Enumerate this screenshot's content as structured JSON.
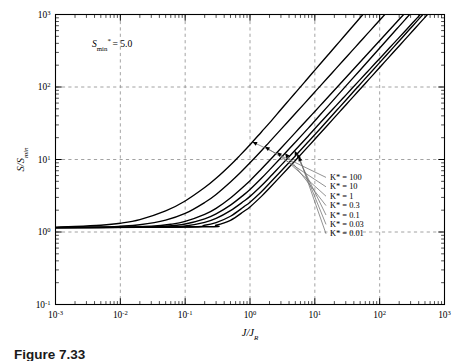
{
  "figure": {
    "caption_fragment": "Figure 7.33",
    "annotation": "S",
    "annotation_sub": "min",
    "annotation_star": "*",
    "annotation_value": "= 5.0"
  },
  "axes": {
    "x": {
      "label_num": "J",
      "label_den": "J",
      "label_den_sub": "R",
      "ticks": [
        "10",
        "10",
        "10",
        "10",
        "10",
        "10",
        "10"
      ],
      "exponents": [
        "-3",
        "-2",
        "-1",
        "0",
        "1",
        "2",
        "3"
      ],
      "min_exp": -3,
      "max_exp": 3
    },
    "y": {
      "label_num": "S",
      "label_den": "S",
      "label_den_sub": "min",
      "ticks": [
        "10",
        "10",
        "10",
        "10",
        "10"
      ],
      "exponents": [
        "-1",
        "0",
        "1",
        "2",
        "3"
      ],
      "min_exp": -1,
      "max_exp": 3
    },
    "grid": "dashed-decades"
  },
  "legend": {
    "items": [
      {
        "label": "K* = 100",
        "k": 100
      },
      {
        "label": "K* = 10",
        "k": 10
      },
      {
        "label": "K* = 1",
        "k": 1
      },
      {
        "label": "K* = 0.3",
        "k": 0.3
      },
      {
        "label": "K* = 0.1",
        "k": 0.1
      },
      {
        "label": "K* = 0.03",
        "k": 0.03
      },
      {
        "label": "K* = 0.01",
        "k": 0.01
      }
    ]
  },
  "colors": {
    "curve": "#000000",
    "grid": "#8c8c8c",
    "axis": "#000000",
    "leader": "#6e6e6e",
    "background": "#ffffff"
  },
  "chart_data": {
    "type": "line",
    "title": "",
    "xlabel": "J/J_R",
    "ylabel": "S/S_min",
    "xscale": "log",
    "yscale": "log",
    "xlim": [
      0.001,
      1000
    ],
    "ylim": [
      0.1,
      1000
    ],
    "grid": true,
    "legend_position": "right-inside",
    "annotations": [
      "S_min* = 5.0"
    ],
    "plateau_value": 1.15,
    "series": [
      {
        "name": "K* = 100",
        "x": [
          0.001,
          0.002,
          0.005,
          0.01,
          0.02,
          0.05,
          0.1,
          0.2,
          0.3,
          0.5,
          0.7,
          1.0,
          1.5,
          2.0,
          3.0,
          4.0
        ],
        "y": [
          1.17,
          1.19,
          1.24,
          1.32,
          1.48,
          1.95,
          2.68,
          4.1,
          5.5,
          8.4,
          11.4,
          16.0,
          24.0,
          32.0,
          49.0,
          66.0
        ]
      },
      {
        "name": "K* = 10",
        "x": [
          0.001,
          0.005,
          0.01,
          0.02,
          0.05,
          0.1,
          0.2,
          0.3,
          0.5,
          0.7,
          1.0,
          1.5,
          2.0,
          3.0,
          5.0,
          7.0
        ],
        "y": [
          1.15,
          1.17,
          1.2,
          1.26,
          1.46,
          1.8,
          2.55,
          3.3,
          4.9,
          6.5,
          9.0,
          13.2,
          17.5,
          26.0,
          43.0,
          60.0
        ]
      },
      {
        "name": "K* = 1",
        "x": [
          0.001,
          0.01,
          0.03,
          0.06,
          0.1,
          0.2,
          0.3,
          0.5,
          0.8,
          1.0,
          1.5,
          2.0,
          3.0,
          5.0,
          8.0,
          10.0
        ],
        "y": [
          1.15,
          1.16,
          1.2,
          1.28,
          1.4,
          1.75,
          2.12,
          2.95,
          4.25,
          5.1,
          7.4,
          9.7,
          14.3,
          23.5,
          37.0,
          46.0
        ]
      },
      {
        "name": "K* = 0.3",
        "x": [
          0.001,
          0.02,
          0.05,
          0.1,
          0.2,
          0.3,
          0.5,
          0.8,
          1.0,
          1.5,
          2.0,
          3.0,
          5.0,
          8.0,
          12.0
        ],
        "y": [
          1.15,
          1.16,
          1.2,
          1.29,
          1.52,
          1.78,
          2.35,
          3.25,
          3.85,
          5.5,
          7.2,
          10.6,
          17.3,
          27.3,
          41.0
        ]
      },
      {
        "name": "K* = 0.1",
        "x": [
          0.001,
          0.05,
          0.1,
          0.2,
          0.3,
          0.5,
          0.8,
          1.0,
          1.5,
          2.0,
          3.0,
          5.0,
          8.0,
          12.0,
          16.0
        ],
        "y": [
          1.15,
          1.17,
          1.21,
          1.36,
          1.54,
          1.97,
          2.65,
          3.1,
          4.35,
          5.65,
          8.3,
          13.5,
          21.3,
          31.8,
          42.0
        ]
      },
      {
        "name": "K* = 0.03",
        "x": [
          0.001,
          0.1,
          0.2,
          0.3,
          0.5,
          0.8,
          1.0,
          1.5,
          2.0,
          3.0,
          5.0,
          8.0,
          12.0,
          18.0
        ],
        "y": [
          1.15,
          1.17,
          1.24,
          1.35,
          1.65,
          2.22,
          2.58,
          3.6,
          4.7,
          6.9,
          11.2,
          17.7,
          26.4,
          39.5
        ]
      },
      {
        "name": "K* = 0.01",
        "x": [
          0.001,
          0.2,
          0.3,
          0.5,
          0.8,
          1.0,
          1.5,
          2.0,
          3.0,
          5.0,
          8.0,
          12.0,
          20.0
        ],
        "y": [
          1.15,
          1.18,
          1.24,
          1.45,
          1.92,
          2.22,
          3.1,
          4.05,
          5.95,
          9.7,
          15.3,
          22.8,
          37.8
        ]
      }
    ]
  }
}
